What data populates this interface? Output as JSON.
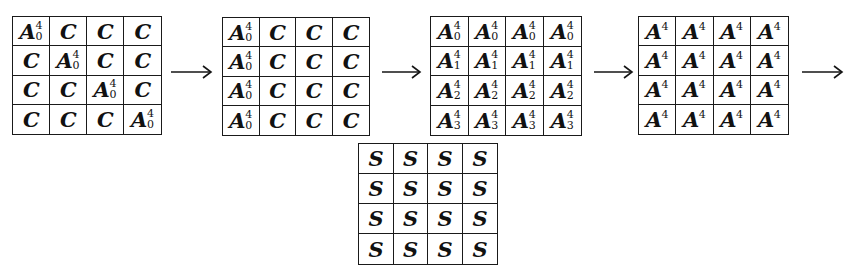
{
  "figure": {
    "type": "diagram",
    "background_color": "#ffffff",
    "ink_color": "#111111"
  },
  "symbols": {
    "A": "A",
    "C": "C",
    "S": "S",
    "exponent": "4"
  },
  "matrices": [
    {
      "name": "matrix-1",
      "rows": 4,
      "cols": 4,
      "cells": [
        [
          {
            "base": "A",
            "sup": "4",
            "sub": "0"
          },
          {
            "base": "C",
            "sup": "",
            "sub": ""
          },
          {
            "base": "C",
            "sup": "",
            "sub": ""
          },
          {
            "base": "C",
            "sup": "",
            "sub": ""
          }
        ],
        [
          {
            "base": "C",
            "sup": "",
            "sub": ""
          },
          {
            "base": "A",
            "sup": "4",
            "sub": "0"
          },
          {
            "base": "C",
            "sup": "",
            "sub": ""
          },
          {
            "base": "C",
            "sup": "",
            "sub": ""
          }
        ],
        [
          {
            "base": "C",
            "sup": "",
            "sub": ""
          },
          {
            "base": "C",
            "sup": "",
            "sub": ""
          },
          {
            "base": "A",
            "sup": "4",
            "sub": "0"
          },
          {
            "base": "C",
            "sup": "",
            "sub": ""
          }
        ],
        [
          {
            "base": "C",
            "sup": "",
            "sub": ""
          },
          {
            "base": "C",
            "sup": "",
            "sub": ""
          },
          {
            "base": "C",
            "sup": "",
            "sub": ""
          },
          {
            "base": "A",
            "sup": "4",
            "sub": "0"
          }
        ]
      ]
    },
    {
      "name": "matrix-2",
      "rows": 4,
      "cols": 4,
      "cells": [
        [
          {
            "base": "A",
            "sup": "4",
            "sub": "0"
          },
          {
            "base": "C",
            "sup": "",
            "sub": ""
          },
          {
            "base": "C",
            "sup": "",
            "sub": ""
          },
          {
            "base": "C",
            "sup": "",
            "sub": ""
          }
        ],
        [
          {
            "base": "A",
            "sup": "4",
            "sub": "0"
          },
          {
            "base": "C",
            "sup": "",
            "sub": ""
          },
          {
            "base": "C",
            "sup": "",
            "sub": ""
          },
          {
            "base": "C",
            "sup": "",
            "sub": ""
          }
        ],
        [
          {
            "base": "A",
            "sup": "4",
            "sub": "0"
          },
          {
            "base": "C",
            "sup": "",
            "sub": ""
          },
          {
            "base": "C",
            "sup": "",
            "sub": ""
          },
          {
            "base": "C",
            "sup": "",
            "sub": ""
          }
        ],
        [
          {
            "base": "A",
            "sup": "4",
            "sub": "0"
          },
          {
            "base": "C",
            "sup": "",
            "sub": ""
          },
          {
            "base": "C",
            "sup": "",
            "sub": ""
          },
          {
            "base": "C",
            "sup": "",
            "sub": ""
          }
        ]
      ]
    },
    {
      "name": "matrix-3",
      "rows": 4,
      "cols": 4,
      "cells": [
        [
          {
            "base": "A",
            "sup": "4",
            "sub": "0"
          },
          {
            "base": "A",
            "sup": "4",
            "sub": "0"
          },
          {
            "base": "A",
            "sup": "4",
            "sub": "0"
          },
          {
            "base": "A",
            "sup": "4",
            "sub": "0"
          }
        ],
        [
          {
            "base": "A",
            "sup": "4",
            "sub": "1"
          },
          {
            "base": "A",
            "sup": "4",
            "sub": "1"
          },
          {
            "base": "A",
            "sup": "4",
            "sub": "1"
          },
          {
            "base": "A",
            "sup": "4",
            "sub": "1"
          }
        ],
        [
          {
            "base": "A",
            "sup": "4",
            "sub": "2"
          },
          {
            "base": "A",
            "sup": "4",
            "sub": "2"
          },
          {
            "base": "A",
            "sup": "4",
            "sub": "2"
          },
          {
            "base": "A",
            "sup": "4",
            "sub": "2"
          }
        ],
        [
          {
            "base": "A",
            "sup": "4",
            "sub": "3"
          },
          {
            "base": "A",
            "sup": "4",
            "sub": "3"
          },
          {
            "base": "A",
            "sup": "4",
            "sub": "3"
          },
          {
            "base": "A",
            "sup": "4",
            "sub": "3"
          }
        ]
      ]
    },
    {
      "name": "matrix-4",
      "rows": 4,
      "cols": 4,
      "cells": [
        [
          {
            "base": "A",
            "sup": "4",
            "sub": ""
          },
          {
            "base": "A",
            "sup": "4",
            "sub": ""
          },
          {
            "base": "A",
            "sup": "4",
            "sub": ""
          },
          {
            "base": "A",
            "sup": "4",
            "sub": ""
          }
        ],
        [
          {
            "base": "A",
            "sup": "4",
            "sub": ""
          },
          {
            "base": "A",
            "sup": "4",
            "sub": ""
          },
          {
            "base": "A",
            "sup": "4",
            "sub": ""
          },
          {
            "base": "A",
            "sup": "4",
            "sub": ""
          }
        ],
        [
          {
            "base": "A",
            "sup": "4",
            "sub": ""
          },
          {
            "base": "A",
            "sup": "4",
            "sub": ""
          },
          {
            "base": "A",
            "sup": "4",
            "sub": ""
          },
          {
            "base": "A",
            "sup": "4",
            "sub": ""
          }
        ],
        [
          {
            "base": "A",
            "sup": "4",
            "sub": ""
          },
          {
            "base": "A",
            "sup": "4",
            "sub": ""
          },
          {
            "base": "A",
            "sup": "4",
            "sub": ""
          },
          {
            "base": "A",
            "sup": "4",
            "sub": ""
          }
        ]
      ]
    },
    {
      "name": "matrix-s",
      "rows": 4,
      "cols": 4,
      "cells": [
        [
          {
            "base": "S",
            "sup": "",
            "sub": ""
          },
          {
            "base": "S",
            "sup": "",
            "sub": ""
          },
          {
            "base": "S",
            "sup": "",
            "sub": ""
          },
          {
            "base": "S",
            "sup": "",
            "sub": ""
          }
        ],
        [
          {
            "base": "S",
            "sup": "",
            "sub": ""
          },
          {
            "base": "S",
            "sup": "",
            "sub": ""
          },
          {
            "base": "S",
            "sup": "",
            "sub": ""
          },
          {
            "base": "S",
            "sup": "",
            "sub": ""
          }
        ],
        [
          {
            "base": "S",
            "sup": "",
            "sub": ""
          },
          {
            "base": "S",
            "sup": "",
            "sub": ""
          },
          {
            "base": "S",
            "sup": "",
            "sub": ""
          },
          {
            "base": "S",
            "sup": "",
            "sub": ""
          }
        ],
        [
          {
            "base": "S",
            "sup": "",
            "sub": ""
          },
          {
            "base": "S",
            "sup": "",
            "sub": ""
          },
          {
            "base": "S",
            "sup": "",
            "sub": ""
          },
          {
            "base": "S",
            "sup": "",
            "sub": ""
          }
        ]
      ]
    }
  ],
  "arrows": [
    {
      "name": "arrow-1",
      "glyph": "→"
    },
    {
      "name": "arrow-2",
      "glyph": "→"
    },
    {
      "name": "arrow-3",
      "glyph": "→"
    },
    {
      "name": "arrow-4",
      "glyph": "→"
    }
  ]
}
